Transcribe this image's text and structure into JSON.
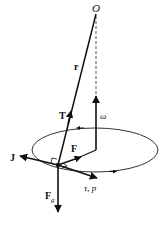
{
  "diagram": {
    "type": "conical-pendulum-vector-diagram",
    "labels": {
      "origin": "O",
      "position_vector": "r",
      "tension": "T",
      "angular_velocity": "ω",
      "angular_momentum": "J",
      "net_force": "F",
      "torque_momentum": "τ, p",
      "gravity_main": "F",
      "gravity_sub": "g"
    },
    "colors": {
      "stroke": "#111111",
      "ellipse": "#333333",
      "dashed": "#555555",
      "background": "#ffffff"
    }
  }
}
